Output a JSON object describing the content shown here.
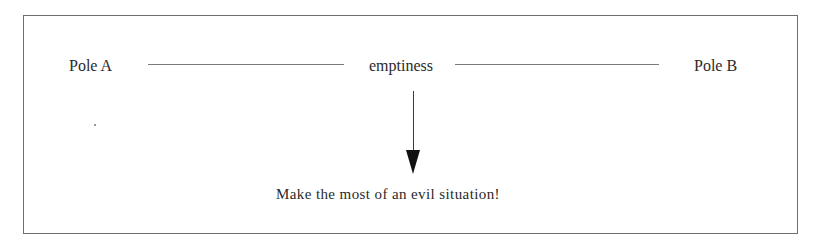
{
  "diagram": {
    "pole_a": "Pole A",
    "center_label": "emptiness",
    "pole_b": "Pole B",
    "caption": "Make the most of an evil situation!"
  }
}
